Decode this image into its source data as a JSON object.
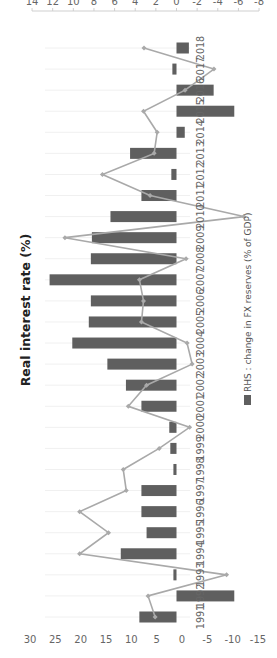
{
  "chart_data": {
    "type": "bar",
    "title": "Real interest rate (%)",
    "orientation_note": "figure rotated 90 degrees counter-clockwise",
    "categories": [
      "1991",
      "1992",
      "1993",
      "1994",
      "1995",
      "1996",
      "1997",
      "1998",
      "1999",
      "2000",
      "2001",
      "2002",
      "2003",
      "2004",
      "2005",
      "2006",
      "2007",
      "2008",
      "2009",
      "2010",
      "2011",
      "2012",
      "2013",
      "2014",
      "2015",
      "2016",
      "2017",
      "2018"
    ],
    "series": [
      {
        "name": "Real interest rate (%)",
        "type": "line",
        "axis": "left",
        "color": "#a9a9a9",
        "values": [
          5.3,
          6.7,
          -8.8,
          20.2,
          14.5,
          20.2,
          11.0,
          11.6,
          4.5,
          -1.5,
          10.6,
          7.0,
          -2.0,
          -1.0,
          8.0,
          7.6,
          8.4,
          -0.8,
          23.1,
          -12.2,
          6.3,
          15.7,
          5.5,
          4.9,
          7.6,
          -0.6,
          -6.3,
          7.5
        ]
      },
      {
        "name": "RHS : change in FX reserves (% of GDP)",
        "type": "bar",
        "axis": "right",
        "color": "#5f5f5f",
        "values": [
          3.6,
          -5.6,
          0.3,
          5.4,
          2.9,
          3.4,
          3.4,
          0.3,
          0.6,
          0.7,
          3.4,
          4.9,
          6.7,
          10.1,
          8.5,
          8.3,
          12.3,
          8.3,
          8.2,
          6.4,
          3.4,
          0.5,
          4.5,
          -0.8,
          -5.6,
          -3.6,
          0.4,
          -1.2
        ]
      }
    ],
    "left_axis": {
      "ticks": [
        "30",
        "25",
        "20",
        "15",
        "10",
        "5",
        "0",
        "-5",
        "-10",
        "-15"
      ],
      "ylim": [
        -15,
        30
      ]
    },
    "right_axis": {
      "ticks": [
        "14",
        "12",
        "10",
        "8",
        "6",
        "4",
        "2",
        "0",
        "-2",
        "-4",
        "-6",
        "-8"
      ],
      "ylim": [
        -8,
        14
      ]
    },
    "legend": {
      "label": "RHS : change in FX reserves (% of GDP)",
      "position": "bottom"
    },
    "grid": true,
    "xlabel": "",
    "ylabel": ""
  }
}
